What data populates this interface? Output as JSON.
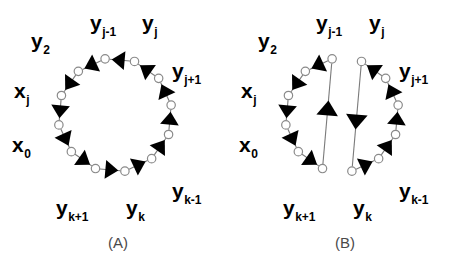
{
  "figure": {
    "width": 457,
    "height": 271,
    "background_color": "#ffffff",
    "node_fill_color": "#ffffff",
    "node_stroke_color": "#8a8a8a",
    "edge_color": "#7a7a7a",
    "arrow_color": "#000000",
    "caption_color": "#4a4a4a"
  },
  "panels": [
    {
      "id": "A",
      "caption": "(A)",
      "caption_x": 118,
      "caption_y": 248,
      "center_x": 115,
      "center_y": 115,
      "radius": 57,
      "node_count": 12,
      "description": "simple directed cycle",
      "labels": [
        {
          "base": "y",
          "sub": "2",
          "x": 31,
          "y": 48,
          "anchor": "start"
        },
        {
          "base": "y",
          "sub": "j-1",
          "x": 90,
          "y": 30,
          "anchor": "start"
        },
        {
          "base": "y",
          "sub": "j",
          "x": 142,
          "y": 30,
          "anchor": "start"
        },
        {
          "base": "y",
          "sub": "j+1",
          "x": 172,
          "y": 78,
          "anchor": "start"
        },
        {
          "base": "y",
          "sub": "k-1",
          "x": 172,
          "y": 198,
          "anchor": "start"
        },
        {
          "base": "y",
          "sub": "k",
          "x": 126,
          "y": 215,
          "anchor": "start"
        },
        {
          "base": "y",
          "sub": "k+1",
          "x": 56,
          "y": 215,
          "anchor": "start"
        },
        {
          "base": "x",
          "sub": "0",
          "x": 12,
          "y": 152,
          "anchor": "start"
        },
        {
          "base": "x",
          "sub": "j",
          "x": 14,
          "y": 98,
          "anchor": "start"
        }
      ]
    },
    {
      "id": "B",
      "caption": "(B)",
      "caption_x": 345,
      "caption_y": 248,
      "center_x": 342,
      "center_y": 115,
      "radius": 57,
      "node_count": 12,
      "description": "cycle with two long crossing chords forming an X",
      "labels": [
        {
          "base": "y",
          "sub": "2",
          "x": 258,
          "y": 48,
          "anchor": "start"
        },
        {
          "base": "y",
          "sub": "j-1",
          "x": 316,
          "y": 30,
          "anchor": "start"
        },
        {
          "base": "y",
          "sub": "j",
          "x": 369,
          "y": 30,
          "anchor": "start"
        },
        {
          "base": "y",
          "sub": "j+1",
          "x": 399,
          "y": 78,
          "anchor": "start"
        },
        {
          "base": "y",
          "sub": "k-1",
          "x": 399,
          "y": 198,
          "anchor": "start"
        },
        {
          "base": "y",
          "sub": "k",
          "x": 353,
          "y": 215,
          "anchor": "start"
        },
        {
          "base": "y",
          "sub": "k+1",
          "x": 283,
          "y": 215,
          "anchor": "start"
        },
        {
          "base": "x",
          "sub": "0",
          "x": 239,
          "y": 152,
          "anchor": "start"
        },
        {
          "base": "x",
          "sub": "j",
          "x": 241,
          "y": 98,
          "anchor": "start"
        }
      ]
    }
  ],
  "chart_data": {
    "type": "diagram",
    "title": "",
    "panel_labels": [
      "(A)",
      "(B)"
    ],
    "node_labels": [
      "y_2",
      "y_{j-1}",
      "y_j",
      "y_{j+1}",
      "y_{k-1}",
      "y_k",
      "y_{k+1}",
      "x_0",
      "x_j"
    ],
    "nodes_per_panel": 12,
    "panel_a_edges": "12 directed edges forming a single counterclockwise cycle around the circle",
    "panel_b_edges": "cycle broken by two long chords that cross in the middle, connecting y_{j-1} to the lower-middle node and the lower node back up to y_j"
  }
}
